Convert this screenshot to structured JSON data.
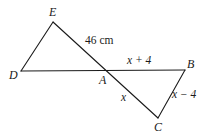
{
  "figure": {
    "type": "geometry-diagram",
    "width": 214,
    "height": 136,
    "background_color": "#ffffff",
    "stroke_color": "#1a1a1a",
    "stroke_width": 1.1
  },
  "vertices": [
    {
      "name": "E",
      "label": "E",
      "x": 53,
      "y": 22
    },
    {
      "name": "D",
      "label": "D",
      "x": 21,
      "y": 71
    },
    {
      "name": "A",
      "label": "A",
      "x": 104,
      "y": 69
    },
    {
      "name": "B",
      "label": "B",
      "x": 185,
      "y": 70
    },
    {
      "name": "C",
      "label": "C",
      "x": 158,
      "y": 118
    }
  ],
  "segments": [
    {
      "name": "segment-DE",
      "from": "D",
      "to": "E",
      "x1": 21,
      "y1": 71,
      "x2": 53,
      "y2": 22
    },
    {
      "name": "segment-EC",
      "from": "E",
      "to": "C",
      "x1": 53,
      "y1": 22,
      "x2": 158,
      "y2": 118
    },
    {
      "name": "segment-DB",
      "from": "D",
      "to": "B",
      "x1": 21,
      "y1": 71,
      "x2": 185,
      "y2": 70
    },
    {
      "name": "segment-BC",
      "from": "B",
      "to": "C",
      "x1": 185,
      "y1": 70,
      "x2": 158,
      "y2": 118
    }
  ],
  "measurements": [
    {
      "name": "length-EA",
      "label": "46 cm",
      "on_segment": "E-A"
    },
    {
      "name": "length-AB",
      "label": "x + 4",
      "on_segment": "A-B"
    },
    {
      "name": "length-AC",
      "label": "x",
      "on_segment": "A-C"
    },
    {
      "name": "length-BC",
      "label": "x − 4",
      "on_segment": "B-C"
    }
  ],
  "labels": {
    "E": "E",
    "D": "D",
    "A": "A",
    "B": "B",
    "C": "C",
    "len_46cm": "46 cm",
    "len_x_plus_4": "x + 4",
    "len_x": "x",
    "len_x_minus_4": "x − 4"
  }
}
